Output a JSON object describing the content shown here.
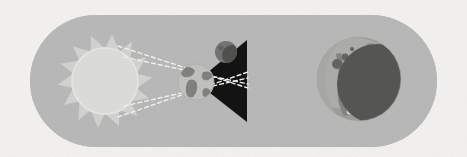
{
  "illustration": {
    "title": "Lunar Eclipse Diagram",
    "caption": "Sun rays cast Earth's shadow cone onto the Moon",
    "background_color": "#f4f3f1",
    "panel": {
      "name": "rounded-pill-panel",
      "fill": "#b5b5b5",
      "x": 30,
      "y": 15,
      "width": 407,
      "height": 132,
      "corner_radius": 66
    },
    "scene_left": {
      "label": "Sun-Earth-Moon alignment",
      "sun": {
        "label": "Sun",
        "center_x": 105,
        "center_y": 81,
        "core_radius": 33,
        "ray_radius": 48,
        "ray_count": 14,
        "core_fill": "#d9d9d7",
        "ray_fill": "#cfcfcd",
        "outline": "#e4e4e2"
      },
      "earth": {
        "label": "Earth",
        "center_x": 196,
        "center_y": 82,
        "radius": 18,
        "ocean_fill": "#bdbdbb",
        "land_fill": "#7c7c7a"
      },
      "moon_small": {
        "label": "Moon in umbra",
        "center_x": 226,
        "center_y": 52,
        "radius": 11,
        "fill": "#6e6e6c",
        "shade_fill": "#4a4a48"
      },
      "shadow_cone": {
        "label": "Umbra shadow cone",
        "fill": "#0a0a0a",
        "apex_x": 196,
        "apex_y": 82,
        "base_x": 247,
        "base_top_y": 40,
        "base_bottom_y": 122
      },
      "light_rays": {
        "label": "Sunlight rays",
        "stroke": "#f0efec",
        "dash": "4 3",
        "width": 1.4,
        "count": 4
      }
    },
    "scene_right": {
      "label": "Eclipsed Moon close-up",
      "moon": {
        "label": "Moon",
        "center_x": 359,
        "center_y": 79,
        "radius": 42,
        "surface_fill": "#989896",
        "highlight_fill": "#a8a8a6",
        "maria_fill": "#7e7e7c"
      },
      "umbra": {
        "label": "Earth umbra on Moon",
        "fill": "#4f4f4d",
        "center_x": 377,
        "center_y": 84,
        "radius": 40
      },
      "craters": [
        {
          "name": "crater-1",
          "cx": 337,
          "cy": 64,
          "r": 5.0,
          "fill": "#5d5d5b"
        },
        {
          "name": "crater-2",
          "cx": 345,
          "cy": 57,
          "r": 3.4,
          "fill": "#5d5d5b"
        },
        {
          "name": "crater-3",
          "cx": 352,
          "cy": 49,
          "r": 2.0,
          "fill": "#5d5d5b"
        },
        {
          "name": "crater-4",
          "cx": 341,
          "cy": 84,
          "r": 2.8,
          "fill": "#5d5d5b"
        },
        {
          "name": "crater-5",
          "cx": 349,
          "cy": 112,
          "r": 2.4,
          "fill": "#d6d6d4"
        },
        {
          "name": "crater-6",
          "cx": 371,
          "cy": 52,
          "r": 9.0,
          "fill": "#8b8b89"
        }
      ]
    }
  }
}
